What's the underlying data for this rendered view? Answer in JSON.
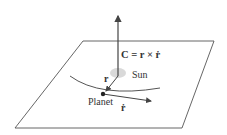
{
  "diagram": {
    "equation": "C = r × ṙ",
    "labels": {
      "sun": "Sun",
      "planet": "Planet",
      "r": "r",
      "rdot": "ṙ"
    },
    "colors": {
      "line": "#444444",
      "sun": "#d9d9d9",
      "planet": "#222222"
    }
  }
}
